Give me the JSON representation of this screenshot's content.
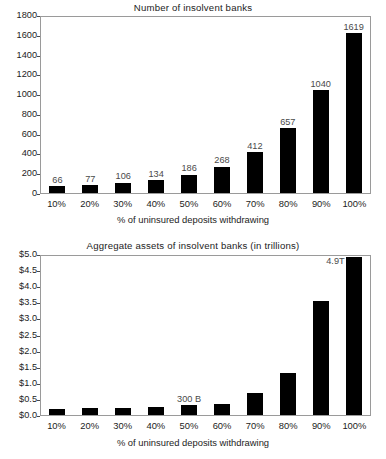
{
  "chart_data": [
    {
      "id": "number-of-insolvent-banks",
      "type": "bar",
      "title": "Number of insolvent banks",
      "xlabel": "% of uninsured deposits withdrawing",
      "ylabel": "",
      "categories": [
        "10%",
        "20%",
        "30%",
        "40%",
        "50%",
        "60%",
        "70%",
        "80%",
        "90%",
        "100%"
      ],
      "values": [
        66,
        77,
        106,
        134,
        186,
        268,
        412,
        657,
        1040,
        1619
      ],
      "data_labels": [
        "66",
        "77",
        "106",
        "134",
        "186",
        "268",
        "412",
        "657",
        "1040",
        "1619"
      ],
      "ylim": [
        0,
        1800
      ],
      "ytick_step": 200,
      "yticks": [
        "0",
        "200",
        "400",
        "600",
        "800",
        "1000",
        "1200",
        "1400",
        "1600",
        "1800"
      ],
      "grid": false,
      "legend": "none",
      "bar_color": "#000000"
    },
    {
      "id": "aggregate-assets-of-insolvent-banks",
      "type": "bar",
      "title": "Aggregate assets of insolvent banks (in trillions)",
      "xlabel": "% of uninsured deposits withdrawing",
      "ylabel": "",
      "categories": [
        "10%",
        "20%",
        "30%",
        "40%",
        "50%",
        "60%",
        "70%",
        "80%",
        "90%",
        "100%"
      ],
      "values": [
        0.19,
        0.22,
        0.23,
        0.26,
        0.3,
        0.33,
        0.67,
        1.3,
        3.55,
        4.9
      ],
      "annotations": [
        {
          "category": "50%",
          "text": "300 B",
          "position": "above"
        },
        {
          "category": "100%",
          "text": "4.9T",
          "position": "left"
        }
      ],
      "ylim": [
        0,
        5.0
      ],
      "ytick_step": 0.5,
      "yticks": [
        "$0.0",
        "$0.5",
        "$1.0",
        "$1.5",
        "$2.0",
        "$2.5",
        "$3.0",
        "$3.5",
        "$4.0",
        "$4.5",
        "$5.0"
      ],
      "grid": false,
      "legend": "none",
      "bar_color": "#000000"
    }
  ]
}
